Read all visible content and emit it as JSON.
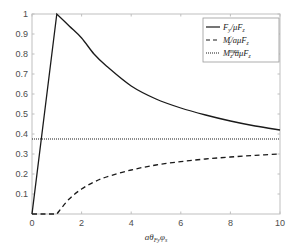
{
  "chart_data": {
    "type": "line",
    "title": "",
    "xlabel": "aθ_Fy φ_s",
    "ylabel": "",
    "xlim": [
      0,
      10
    ],
    "ylim": [
      0,
      1
    ],
    "grid": false,
    "legend_position": "top-right",
    "xticks": [
      0,
      2,
      4,
      6,
      8,
      10
    ],
    "xtick_labels": [
      "0",
      "2",
      "4",
      "6",
      "8",
      "10"
    ],
    "yticks": [
      0.1,
      0.2,
      0.3,
      0.4,
      0.5,
      0.6,
      0.7,
      0.8,
      0.9,
      1
    ],
    "ytick_labels": [
      "0.1",
      "0.2",
      "0.3",
      "0.4",
      "0.5",
      "0.6",
      "0.7",
      "0.8",
      "0.9",
      "1"
    ],
    "series": [
      {
        "name": "F_y/μF_z",
        "style": "solid",
        "x": [
          0,
          1,
          1.5,
          2,
          2.5,
          3,
          4,
          5,
          6,
          7,
          8,
          9,
          10
        ],
        "y": [
          0,
          1,
          0.94,
          0.88,
          0.8,
          0.74,
          0.64,
          0.575,
          0.53,
          0.495,
          0.465,
          0.44,
          0.42
        ]
      },
      {
        "name": "M'_z/aμF_z",
        "style": "dashed",
        "x": [
          0,
          1,
          1.5,
          2,
          2.5,
          3,
          4,
          5,
          6,
          7,
          8,
          9,
          10
        ],
        "y": [
          0,
          0,
          0.075,
          0.125,
          0.16,
          0.185,
          0.22,
          0.245,
          0.262,
          0.275,
          0.285,
          0.293,
          0.3
        ]
      },
      {
        "name": "M_z^max/aμF_z",
        "style": "dotted",
        "x": [
          0,
          10
        ],
        "y": [
          0.375,
          0.375
        ]
      }
    ]
  },
  "legend": {
    "items": [
      {
        "base": "F",
        "sub": "y",
        "sup": "",
        "rest": "/μF",
        "rest_sub": "z",
        "style": "solid"
      },
      {
        "base": "M",
        "sub": "z",
        "sup": "′",
        "rest": "/aμF",
        "rest_sub": "z",
        "style": "dashed"
      },
      {
        "base": "M",
        "sub": "z",
        "sup": "max",
        "rest": "/aμF",
        "rest_sub": "z",
        "style": "dotted"
      }
    ]
  },
  "xlabel_parts": {
    "a": "aθ",
    "sub1": "Fy",
    "phi": "φ",
    "sub2": "s"
  },
  "colors": {
    "axis": "#bfbfbf",
    "line": "#1a1a1a",
    "tick_text": "#4d4d4d"
  }
}
